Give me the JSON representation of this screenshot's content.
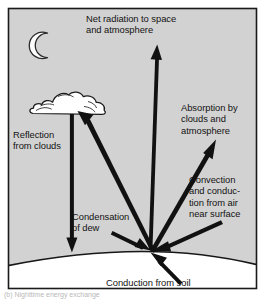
{
  "figure": {
    "colors": {
      "sky": "#d2d2d2",
      "ground": "#ffffff",
      "frame": "#1a1a1a",
      "arrow": "#111111",
      "text": "#121212",
      "moon_fill": "#fdfdfd",
      "cloud_fill": "#ffffff"
    },
    "labels": {
      "net_radiation": "Net radiation to space\nand atmosphere",
      "reflection": "Reflection\nfrom clouds",
      "condensation": "Condensation\nof dew",
      "absorption": "Absorption by\nclouds and\natmosphere",
      "convection": "Convection\nand conduc-\ntion from air\nnear surface",
      "conduction_soil": "Conduction from soil"
    },
    "icons": {
      "moon": "crescent-moon-icon",
      "cloud": "cloud-icon"
    },
    "arrows": [
      {
        "name": "net-radiation-arrow",
        "from": [
          150,
          249
        ],
        "to": [
          157,
          46
        ],
        "direction": "up"
      },
      {
        "name": "reflection-from-clouds-arrow",
        "from": [
          72,
          113
        ],
        "to": [
          72,
          251
        ],
        "direction": "down"
      },
      {
        "name": "condensation-of-dew-arrow",
        "from": [
          150,
          249
        ],
        "to": [
          76,
          114
        ],
        "direction": "up-left"
      },
      {
        "name": "dew-ground-arrow",
        "from": [
          113,
          232
        ],
        "to": [
          148,
          250
        ],
        "direction": "down-right"
      },
      {
        "name": "absorption-by-clouds-arrow",
        "from": [
          150,
          249
        ],
        "to": [
          215,
          140
        ],
        "direction": "up-right"
      },
      {
        "name": "convection-conduction-arrow",
        "from": [
          220,
          222
        ],
        "to": [
          153,
          250
        ],
        "direction": "down-left"
      },
      {
        "name": "conduction-from-soil-arrow",
        "from": [
          178,
          285
        ],
        "to": [
          152,
          253
        ],
        "direction": "up-left"
      }
    ],
    "caption": "(b) Nighttime energy exchange"
  }
}
